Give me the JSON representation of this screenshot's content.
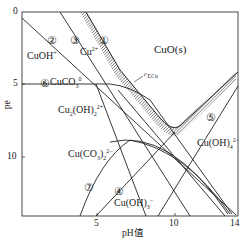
{
  "diagram": {
    "type": "pe-pH predominance diagram (copper-carbonate system)",
    "x_axis": {
      "label": "pH值",
      "ticks": [
        "5",
        "10",
        "14"
      ],
      "range": [
        0,
        14
      ]
    },
    "y_axis": {
      "label": "pe",
      "ticks": [
        "0",
        "5",
        "10"
      ],
      "range": [
        0,
        13
      ],
      "inverted": true
    },
    "regions": {
      "cuoh": "CuOH",
      "cuoh_sup": "+",
      "cu2": "Cu",
      "cu2_sup": "2+",
      "cuo": "CuO(s)",
      "cuco3": "CuCO",
      "cuco3_sub": "3",
      "cuco3_sup": "0",
      "cu2oh2": "Cu",
      "cu2oh2_sub1": "2",
      "cu2oh2_mid": "(OH)",
      "cu2oh2_sub2": "2",
      "cu2oh2_sup": "2+",
      "cuco32": "Cu(CO",
      "cuco32_sub1": "3",
      "cuco32_mid": ")",
      "cuco32_sub2": "2",
      "cuco32_sup": "2−",
      "cuoh3": "Cu(OH)",
      "cuoh3_sub": "3",
      "cuoh3_sup": "−",
      "cuoh4": "Cu(OH)",
      "cuoh4_sub": "4",
      "cuoh4_sup": "2−"
    },
    "annotation": {
      "ctcu": "c",
      "ctcu_sub": "T,Cu"
    },
    "line_numbers": [
      "①",
      "②",
      "③",
      "④",
      "⑤",
      "⑥",
      "⑦"
    ],
    "colors": {
      "line": "#222222",
      "hatch": "#555555",
      "axis": "#333333"
    }
  }
}
